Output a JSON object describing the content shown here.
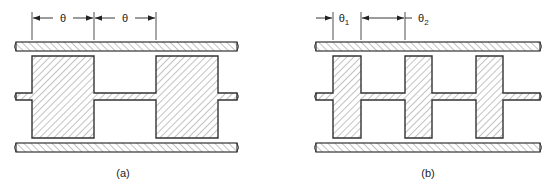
{
  "figure": {
    "panels": [
      {
        "id": "a",
        "caption": "(a)",
        "dimension_labels": [
          "θ",
          "θ"
        ],
        "block_count": 2,
        "description": "Stepped-impedance line with two wide sections of length θ separated by narrow section of length θ"
      },
      {
        "id": "b",
        "caption": "(b)",
        "dimension_labels": [
          "θ",
          "1",
          "θ",
          "2"
        ],
        "block_count": 3,
        "description": "Stepped-impedance line with three narrow high sections of length θ1 separated by sections of length θ2"
      }
    ],
    "colors": {
      "stroke": "#333333",
      "hatch": "#555555",
      "background": "#ffffff"
    }
  }
}
